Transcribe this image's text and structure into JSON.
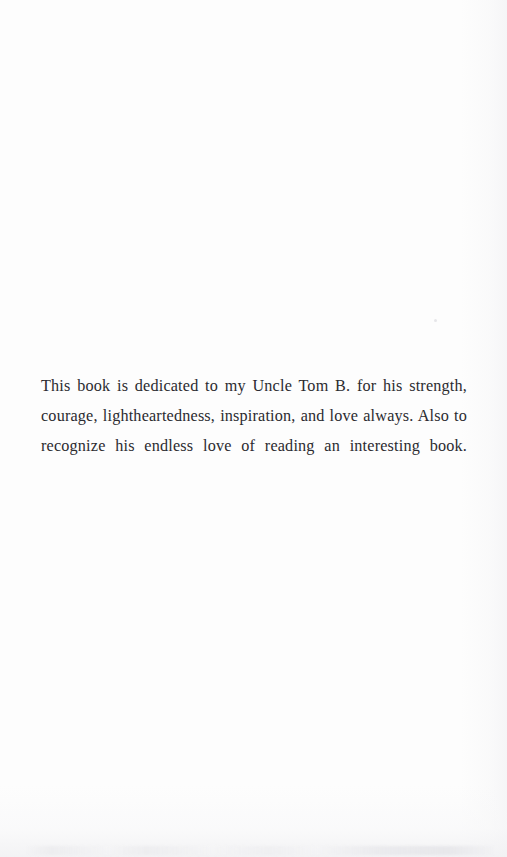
{
  "page": {
    "kind": "book-dedication-page",
    "background_color": "#fdfdfd",
    "text_color": "#2b2b30",
    "width_px": 507,
    "height_px": 857
  },
  "dedication": {
    "text": "This book is dedicated to my Uncle Tom B. for his strength, courage, lightheartedness, inspiration, and love always. Also to recognize his endless love of reading an interesting book.",
    "lines": [
      "This book is dedicated to my Uncle Tom B. for his strength, courage,",
      "lightheartedness, inspiration, and love always. Also to recognize his",
      "endless love of reading an interesting book."
    ],
    "alignment": "justify"
  }
}
